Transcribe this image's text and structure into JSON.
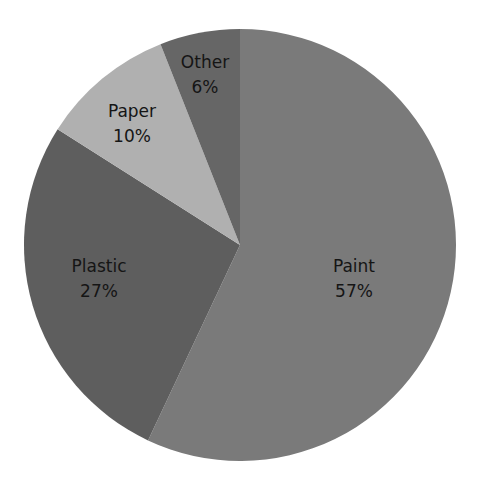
{
  "chart_data": {
    "type": "pie",
    "title": "",
    "categories": [
      "Paint",
      "Plastic",
      "Paper",
      "Other"
    ],
    "values": [
      57,
      27,
      10,
      6
    ],
    "unit": "%",
    "start_angle": "12 o'clock, clockwise starting with Paint",
    "colors": [
      "#7a7a7a",
      "#5e5e5e",
      "#b0b0b0",
      "#666666"
    ],
    "labels": [
      {
        "name": "Paint",
        "pct": "57%"
      },
      {
        "name": "Plastic",
        "pct": "27%"
      },
      {
        "name": "Paper",
        "pct": "10%"
      },
      {
        "name": "Other",
        "pct": "6%"
      }
    ],
    "legend": "none (labels placed inside slices)"
  }
}
